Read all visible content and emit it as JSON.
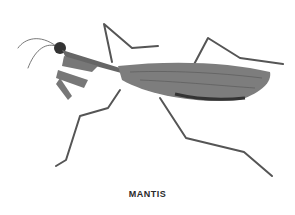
{
  "figure": {
    "caption": "MANTIS",
    "colors": {
      "background": "#ffffff",
      "ink": "#4a4a4a",
      "body": "#6b6b6b"
    }
  }
}
